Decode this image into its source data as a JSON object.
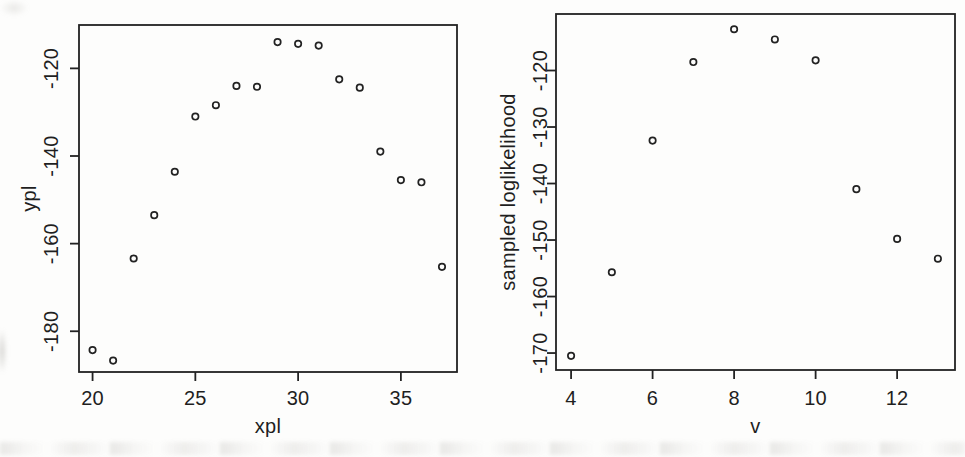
{
  "page": {
    "background": "#fdfdfc",
    "ink": "#222222",
    "artifact_color": "#96948e"
  },
  "chart_data": [
    {
      "type": "scatter",
      "title": "",
      "xlabel": "xpl",
      "ylabel": "ypl",
      "x": [
        20,
        21,
        22,
        23,
        24,
        25,
        26,
        27,
        28,
        29,
        30,
        31,
        32,
        33,
        34,
        35,
        36,
        37
      ],
      "y": [
        -184.3,
        -186.7,
        -163.4,
        -153.5,
        -143.6,
        -131.0,
        -128.4,
        -124.0,
        -124.2,
        -114.0,
        -114.4,
        -114.8,
        -122.5,
        -124.4,
        -139.0,
        -145.5,
        -146.0,
        -165.3
      ],
      "xticks": [
        20,
        25,
        30,
        35
      ],
      "yticks": [
        -180,
        -160,
        -140,
        -120
      ],
      "xlim": [
        19.34,
        37.73
      ],
      "ylim": [
        -189.3,
        -110.1
      ],
      "grid": false,
      "legend": null,
      "marker": "open-circle"
    },
    {
      "type": "scatter",
      "title": "",
      "xlabel": "v",
      "ylabel": "sampled loglikelihood",
      "x": [
        4,
        5,
        6,
        7,
        8,
        9,
        10,
        11,
        12,
        13
      ],
      "y": [
        -170.5,
        -155.7,
        -132.4,
        -118.5,
        -112.7,
        -114.5,
        -118.2,
        -141.0,
        -149.8,
        -153.3
      ],
      "xticks": [
        4,
        6,
        8,
        10,
        12
      ],
      "yticks": [
        -170,
        -160,
        -150,
        -140,
        -130,
        -120
      ],
      "xlim": [
        3.63,
        13.42
      ],
      "ylim": [
        -173.0,
        -110.0
      ],
      "grid": false,
      "legend": null,
      "marker": "open-circle"
    }
  ]
}
